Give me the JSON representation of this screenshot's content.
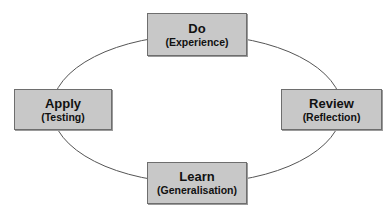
{
  "diagram": {
    "type": "cycle",
    "colors": {
      "box_fill": "#c8c8c8",
      "box_border": "#6e6e6e",
      "line": "#555555",
      "text": "#111111"
    },
    "nodes": [
      {
        "id": "do",
        "title": "Do",
        "subtitle": "(Experience)"
      },
      {
        "id": "review",
        "title": "Review",
        "subtitle": "(Reflection)"
      },
      {
        "id": "learn",
        "title": "Learn",
        "subtitle": "(Generalisation)"
      },
      {
        "id": "apply",
        "title": "Apply",
        "subtitle": "(Testing)"
      }
    ]
  }
}
